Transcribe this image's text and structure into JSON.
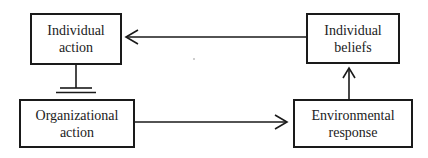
{
  "diagram": {
    "type": "causal-loop-flowchart",
    "nodes": [
      {
        "id": "individual_action",
        "line1": "Individual",
        "line2": "action"
      },
      {
        "id": "individual_beliefs",
        "line1": "Individual",
        "line2": "beliefs"
      },
      {
        "id": "organizational_action",
        "line1": "Organizational",
        "line2": "action"
      },
      {
        "id": "environmental_response",
        "line1": "Environmental",
        "line2": "response"
      }
    ],
    "edges": [
      {
        "from": "individual_beliefs",
        "to": "individual_action",
        "style": "arrow"
      },
      {
        "from": "individual_action",
        "to": "organizational_action",
        "style": "blocked"
      },
      {
        "from": "organizational_action",
        "to": "environmental_response",
        "style": "arrow"
      },
      {
        "from": "environmental_response",
        "to": "individual_beliefs",
        "style": "arrow"
      }
    ],
    "colors": {
      "line": "#1a1a1a",
      "text": "#222222",
      "background": "#ffffff"
    }
  }
}
